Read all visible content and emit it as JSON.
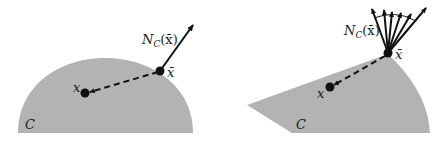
{
  "figure": {
    "colors": {
      "set_fill": "#b3b3b3",
      "ink": "#111111",
      "background": "#ffffff"
    },
    "left_panel": {
      "set_label": "C",
      "point_label": "x",
      "projection_label": "x̄",
      "normal_cone_label_main": "N",
      "normal_cone_label_sub": "C",
      "normal_cone_label_arg": "(x̄)",
      "description": "Smooth convex set: normal cone at x̄ is a single ray"
    },
    "right_panel": {
      "set_label": "C",
      "point_label": "x",
      "projection_label": "x̄",
      "normal_cone_label_main": "N",
      "normal_cone_label_sub": "C",
      "normal_cone_label_arg": "(x̄)",
      "normal_cone_ray_count": 6,
      "description": "Convex set with corner at x̄: normal cone is a fan of rays"
    }
  }
}
